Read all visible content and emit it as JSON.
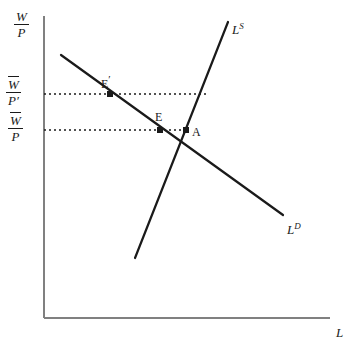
{
  "figure": {
    "type": "labor-market-diagram",
    "background_color": "#ffffff",
    "line_color": "#1a1a1a"
  },
  "axes": {
    "y_axis_label_numerator": "W",
    "y_axis_label_denominator": "P",
    "x_axis_label": "L",
    "origin": {
      "x": 44,
      "y": 318
    },
    "y_top": 16,
    "x_right": 330
  },
  "ticks": [
    {
      "name": "upper-real-wage",
      "numerator": "W",
      "denominator": "P′",
      "y": 94,
      "overbar": true
    },
    {
      "name": "lower-real-wage",
      "numerator": "W",
      "denominator": "P",
      "y": 130,
      "overbar": true
    }
  ],
  "curves": [
    {
      "name": "labor-supply",
      "label": "L",
      "superscript": "S",
      "label_x": 232,
      "label_y": 22,
      "x1": 135,
      "y1": 258,
      "x2": 228,
      "y2": 22
    },
    {
      "name": "labor-demand",
      "label": "L",
      "superscript": "D",
      "label_x": 287,
      "label_y": 222,
      "x1": 61,
      "y1": 55,
      "x2": 283,
      "y2": 215
    }
  ],
  "dotted_lines": [
    {
      "name": "upper-wage-line",
      "y": 94,
      "x_start": 44,
      "x_end": 207
    },
    {
      "name": "lower-wage-line",
      "y": 130,
      "x_start": 44,
      "x_end": 187
    }
  ],
  "points": [
    {
      "name": "point-e-prime",
      "label": "E",
      "prime": "′",
      "x": 110,
      "y": 94,
      "label_x": 101,
      "label_y": 74
    },
    {
      "name": "point-e",
      "label": "E",
      "prime": "",
      "x": 160,
      "y": 130,
      "label_x": 155,
      "label_y": 111
    },
    {
      "name": "point-a",
      "label": "A",
      "prime": "",
      "x": 186,
      "y": 130,
      "label_x": 192,
      "label_y": 126
    }
  ]
}
